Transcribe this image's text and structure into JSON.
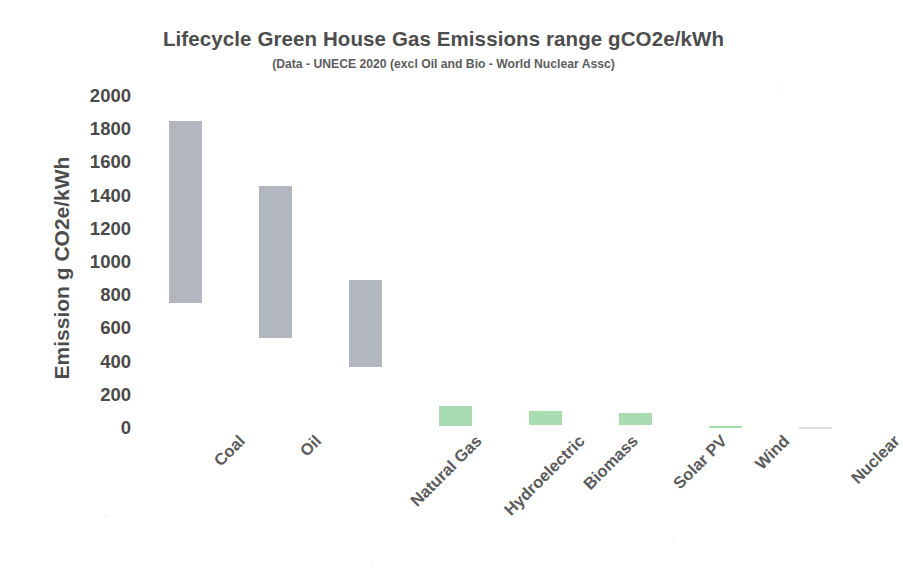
{
  "chart_data": {
    "type": "bar",
    "bar_style": "floating-range",
    "title": "Lifecycle Green House Gas Emissions range gCO2e/kWh",
    "subtitle": "(Data - UNECE 2020 (excl Oil and Bio - World Nuclear Assc)",
    "xlabel": "",
    "ylabel": "Emission g CO2e/kWh",
    "ylim": [
      0,
      2000
    ],
    "ytick_step": 200,
    "yticks": [
      "2000",
      "1800",
      "1600",
      "1400",
      "1200",
      "1000",
      "800",
      "600",
      "400",
      "200",
      "0"
    ],
    "grid": false,
    "legend": "none",
    "categories": [
      "Coal",
      "Oil",
      "Natural Gas",
      "Hydroelectric",
      "Biomass",
      "Solar PV",
      "Wind",
      "Nuclear"
    ],
    "series": [
      {
        "name": "Range low (min gCO2e/kWh)",
        "values": [
          750,
          540,
          370,
          10,
          20,
          15,
          5,
          3
        ]
      },
      {
        "name": "Range high (max gCO2e/kWh)",
        "values": [
          1850,
          1460,
          890,
          130,
          105,
          90,
          15,
          6
        ]
      }
    ],
    "bars": [
      {
        "category": "Coal",
        "low": 750,
        "high": 1850,
        "color": "#b2b6bf",
        "group": "fossil"
      },
      {
        "category": "Oil",
        "low": 540,
        "high": 1460,
        "color": "#b2b6bf",
        "group": "fossil"
      },
      {
        "category": "Natural Gas",
        "low": 370,
        "high": 890,
        "color": "#b2b6bf",
        "group": "fossil"
      },
      {
        "category": "Hydroelectric",
        "low": 10,
        "high": 130,
        "color": "#a9dcb0",
        "group": "low-carbon"
      },
      {
        "category": "Biomass",
        "low": 20,
        "high": 105,
        "color": "#a9dcb0",
        "group": "low-carbon"
      },
      {
        "category": "Solar PV",
        "low": 15,
        "high": 90,
        "color": "#a9dcb0",
        "group": "low-carbon"
      },
      {
        "category": "Wind",
        "low": 5,
        "high": 15,
        "color": "#8fd39a",
        "group": "low-carbon"
      },
      {
        "category": "Nuclear",
        "low": 3,
        "high": 6,
        "color": "#c6c9cf",
        "group": "low-carbon"
      }
    ],
    "colors": {
      "fossil_bar": "#b2b6bf",
      "low_carbon_bar": "#a9dcb0",
      "wind_bar": "#8fd39a",
      "nuclear_bar": "#c6c9cf",
      "text": "#4d4d4d",
      "background": "#ffffff"
    }
  }
}
